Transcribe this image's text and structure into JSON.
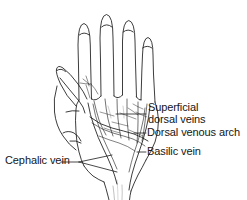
{
  "figure": {
    "view": "dorsum of left hand with forearm",
    "background_color": "#ffffff",
    "ink_color": "#1a1a1a",
    "style": "black and white pen line drawing"
  },
  "labels": {
    "superficial_dorsal_veins": {
      "line1": "Superficial",
      "line2": "dorsal veins"
    },
    "dorsal_venous_arch": "Dorsal venous arch",
    "basilic_vein": "Basilic vein",
    "cephalic_vein": "Cephalic vein"
  },
  "anatomy_parts": [
    "index-finger",
    "middle-finger",
    "ring-finger",
    "little-finger",
    "thumb",
    "dorsum-of-hand",
    "wrist",
    "forearm",
    "superficial-dorsal-veins",
    "dorsal-venous-arch",
    "basilic-vein",
    "cephalic-vein"
  ]
}
